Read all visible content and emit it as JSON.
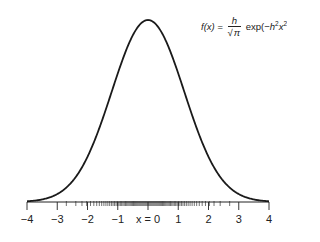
{
  "chart_data": {
    "type": "line",
    "title": "",
    "function_label": "f(x) = h/√π exp(−h²x²)",
    "formula": {
      "lhs": "f(x) =",
      "numerator": "h",
      "denominator_radical": "√",
      "denominator_symbol": "π",
      "rhs_prefix": "exp(−",
      "rhs_h": "h",
      "rhs_h_exp": "2",
      "rhs_x": "x",
      "rhs_x_exp": "2",
      "rhs_suffix": ")"
    },
    "xlabel": "",
    "ylabel": "",
    "xlim": [
      -4,
      4
    ],
    "x_ticks": [
      -4,
      -3,
      -2,
      -1,
      0,
      1,
      2,
      3,
      4
    ],
    "x_tick_labels": [
      "−4",
      "−3",
      "−2",
      "−1",
      "x = 0",
      "1",
      "2",
      "3",
      "4"
    ],
    "parameters": {
      "h": 0.59
    },
    "minor_ticks_note": "dense rug of small ticks along axis, densest near x = 0",
    "series": [
      {
        "name": "f(x)",
        "x": [
          -4,
          -3.5,
          -3,
          -2.5,
          -2,
          -1.5,
          -1,
          -0.5,
          0,
          0.5,
          1,
          1.5,
          2,
          2.5,
          3,
          3.5,
          4
        ],
        "values": [
          0.001,
          0.005,
          0.014,
          0.038,
          0.083,
          0.152,
          0.234,
          0.304,
          0.333,
          0.304,
          0.234,
          0.152,
          0.083,
          0.038,
          0.014,
          0.005,
          0.001
        ]
      }
    ],
    "grid": false,
    "legend": "none"
  },
  "colors": {
    "curve": "#1a1a1a",
    "axis": "#222222",
    "background": "#ffffff"
  }
}
